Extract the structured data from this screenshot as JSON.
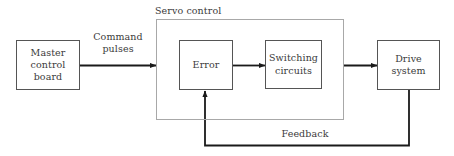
{
  "diagram": {
    "canvas": {
      "width": 454,
      "height": 156,
      "background": "#ffffff"
    },
    "colors": {
      "node_border": "#555555",
      "group_border": "#a8a8a8",
      "connector": "#1a1a1a",
      "text": "#3a3a3a",
      "background": "#ffffff"
    },
    "group": {
      "title": "Servo control",
      "title_x": 155,
      "title_y": 5,
      "x": 156,
      "y": 19,
      "width": 188,
      "height": 101
    },
    "nodes": [
      {
        "id": "master-control-board",
        "label": "Master\ncontrol\nboard",
        "x": 16,
        "y": 40,
        "width": 64,
        "height": 50
      },
      {
        "id": "error",
        "label": "Error",
        "x": 179,
        "y": 40,
        "width": 54,
        "height": 50
      },
      {
        "id": "switching-circuits",
        "label": "Switching\ncircuits",
        "x": 265,
        "y": 40,
        "width": 57,
        "height": 49
      },
      {
        "id": "drive-system",
        "label": "Drive\nsystem",
        "x": 377,
        "y": 40,
        "width": 63,
        "height": 50
      }
    ],
    "edge_labels": [
      {
        "id": "command-pulses",
        "text": "Command\npulses",
        "x": 80,
        "y": 31,
        "width": 76
      },
      {
        "id": "feedback",
        "text": "Feedback",
        "x": 272,
        "y": 128,
        "width": 66
      }
    ],
    "connectors": [
      {
        "id": "master-to-servo",
        "from": "master-control-board",
        "to": "servo-control-group",
        "label": "Command pulses",
        "arrow": "end"
      },
      {
        "id": "error-to-switching",
        "from": "error",
        "to": "switching-circuits",
        "label": "",
        "arrow": "end"
      },
      {
        "id": "servo-to-drive",
        "from": "switching-circuits",
        "to": "drive-system",
        "label": "",
        "arrow": "end"
      },
      {
        "id": "drive-to-error-feedback",
        "from": "drive-system",
        "to": "error",
        "label": "Feedback",
        "arrow": "end"
      }
    ]
  }
}
